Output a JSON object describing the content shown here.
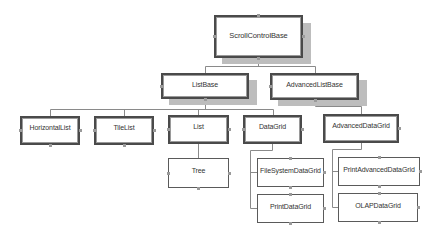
{
  "diagram": {
    "type": "class-hierarchy",
    "root": "ScrollControlBase",
    "nodes": {
      "scroll_control_base": {
        "label": "ScrollControlBase",
        "parent": null
      },
      "list_base": {
        "label": "ListBase",
        "parent": "ScrollControlBase"
      },
      "advanced_list_base": {
        "label": "AdvancedListBase",
        "parent": "ScrollControlBase"
      },
      "horizontal_list": {
        "label": "HorizontalList",
        "parent": "ListBase"
      },
      "tile_list": {
        "label": "TileList",
        "parent": "ListBase"
      },
      "list": {
        "label": "List",
        "parent": "ListBase"
      },
      "data_grid": {
        "label": "DataGrid",
        "parent": "ListBase"
      },
      "advanced_data_grid": {
        "label": "AdvancedDataGrid",
        "parent": "AdvancedListBase"
      },
      "tree": {
        "label": "Tree",
        "parent": "List"
      },
      "file_system_data_grid": {
        "label": "FileSystemDataGrid",
        "parent": "DataGrid"
      },
      "print_data_grid": {
        "label": "PrintDataGrid",
        "parent": "DataGrid"
      },
      "print_advanced_data_grid": {
        "label": "PrintAdvancedDataGrid",
        "parent": "AdvancedDataGrid"
      },
      "olap_data_grid": {
        "label": "OLAPDataGrid",
        "parent": "AdvancedDataGrid"
      }
    },
    "edges": [
      {
        "from": "ScrollControlBase",
        "to": "ListBase"
      },
      {
        "from": "ScrollControlBase",
        "to": "AdvancedListBase"
      },
      {
        "from": "ListBase",
        "to": "HorizontalList"
      },
      {
        "from": "ListBase",
        "to": "TileList"
      },
      {
        "from": "ListBase",
        "to": "List"
      },
      {
        "from": "ListBase",
        "to": "DataGrid"
      },
      {
        "from": "AdvancedListBase",
        "to": "AdvancedDataGrid"
      },
      {
        "from": "List",
        "to": "Tree"
      },
      {
        "from": "DataGrid",
        "to": "FileSystemDataGrid"
      },
      {
        "from": "DataGrid",
        "to": "PrintDataGrid"
      },
      {
        "from": "AdvancedDataGrid",
        "to": "PrintAdvancedDataGrid"
      },
      {
        "from": "AdvancedDataGrid",
        "to": "OLAPDataGrid"
      }
    ],
    "colors": {
      "border": "#4a4a4a",
      "shadow": "#bdbdbd",
      "connector": "#8a8a8a",
      "background": "#ffffff",
      "text": "#333333"
    }
  }
}
